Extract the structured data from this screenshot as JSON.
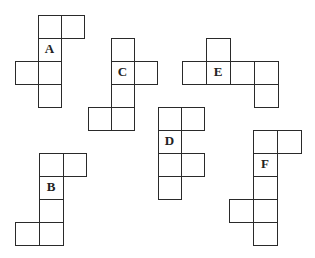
{
  "figure": {
    "stroke_color": "#2a2a2a",
    "nets": [
      {
        "label": "A",
        "label_cell": 2,
        "cells": [
          [
            38,
            15,
            23,
            23
          ],
          [
            61,
            15,
            23,
            23
          ],
          [
            38,
            38,
            23,
            23
          ],
          [
            15,
            61,
            23,
            23
          ],
          [
            38,
            61,
            23,
            23
          ],
          [
            38,
            84,
            23,
            23
          ]
        ]
      },
      {
        "label": "C",
        "label_cell": 1,
        "cells": [
          [
            111,
            38,
            23,
            23
          ],
          [
            111,
            61,
            23,
            23
          ],
          [
            134,
            61,
            23,
            23
          ],
          [
            111,
            84,
            23,
            23
          ],
          [
            88,
            107,
            23,
            23
          ],
          [
            111,
            107,
            23,
            23
          ]
        ]
      },
      {
        "label": "E",
        "label_cell": 2,
        "cells": [
          [
            206,
            38,
            24,
            23
          ],
          [
            182,
            61,
            24,
            23
          ],
          [
            206,
            61,
            24,
            23
          ],
          [
            230,
            61,
            24,
            23
          ],
          [
            254,
            61,
            24,
            23
          ],
          [
            254,
            84,
            24,
            23
          ]
        ]
      },
      {
        "label": "D",
        "label_cell": 2,
        "cells": [
          [
            158,
            107,
            23,
            23
          ],
          [
            181,
            107,
            23,
            23
          ],
          [
            158,
            130,
            23,
            23
          ],
          [
            158,
            153,
            23,
            23
          ],
          [
            181,
            153,
            23,
            23
          ],
          [
            158,
            176,
            23,
            23
          ]
        ]
      },
      {
        "label": "B",
        "label_cell": 2,
        "cells": [
          [
            39,
            153,
            24,
            23
          ],
          [
            63,
            153,
            23,
            23
          ],
          [
            39,
            176,
            24,
            23
          ],
          [
            39,
            199,
            24,
            23
          ],
          [
            15,
            222,
            24,
            23
          ],
          [
            39,
            222,
            24,
            23
          ]
        ]
      },
      {
        "label": "F",
        "label_cell": 2,
        "cells": [
          [
            253,
            130,
            24,
            23
          ],
          [
            277,
            130,
            24,
            23
          ],
          [
            253,
            153,
            24,
            23
          ],
          [
            253,
            176,
            24,
            23
          ],
          [
            229,
            199,
            24,
            23
          ],
          [
            253,
            199,
            24,
            23
          ],
          [
            253,
            222,
            24,
            23
          ]
        ]
      }
    ]
  }
}
